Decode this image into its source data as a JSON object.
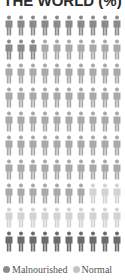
{
  "title": "THE WORLD (%)",
  "legend": [
    {
      "label": "Malnourished",
      "color": "#8c8c8c"
    },
    {
      "label": "Normal",
      "color": "#c4c4c4"
    }
  ],
  "colors": {
    "dark": "#8a8a8a",
    "medium": "#a9a9a9",
    "light": "#d3d3d3",
    "darkest": "#6b6b6b"
  },
  "chart_data": {
    "type": "pictogram",
    "title": "THE WORLD (%)",
    "grid": {
      "rows": 10,
      "cols": 10,
      "unit": "1 figure = 1%"
    },
    "rows": [
      [
        "dark",
        "dark",
        "dark",
        "dark",
        "dark",
        "dark",
        "dark",
        "dark",
        "dark",
        "dark"
      ],
      [
        "dark",
        "dark",
        "dark",
        "medium",
        "medium",
        "medium",
        "medium",
        "medium",
        "medium",
        "medium"
      ],
      [
        "medium",
        "medium",
        "medium",
        "medium",
        "medium",
        "medium",
        "medium",
        "medium",
        "medium",
        "medium"
      ],
      [
        "medium",
        "medium",
        "medium",
        "medium",
        "medium",
        "medium",
        "medium",
        "medium",
        "medium",
        "medium"
      ],
      [
        "medium",
        "medium",
        "medium",
        "medium",
        "medium",
        "medium",
        "medium",
        "medium",
        "medium",
        "medium"
      ],
      [
        "medium",
        "medium",
        "medium",
        "medium",
        "medium",
        "medium",
        "medium",
        "medium",
        "medium",
        "medium"
      ],
      [
        "medium",
        "medium",
        "medium",
        "medium",
        "medium",
        "medium",
        "medium",
        "medium",
        "medium",
        "medium"
      ],
      [
        "medium",
        "medium",
        "medium",
        "medium",
        "medium",
        "medium",
        "medium",
        "light",
        "light",
        "light"
      ],
      [
        "light",
        "light",
        "light",
        "light",
        "light",
        "light",
        "light",
        "light",
        "light",
        "light"
      ],
      [
        "darkest",
        "darkest",
        "darkest",
        "darkest",
        "darkest",
        "darkest",
        "darkest",
        "darkest",
        "darkest",
        "darkest"
      ]
    ],
    "counts": {
      "dark": 13,
      "medium": 64,
      "light": 13,
      "darkest": 10
    },
    "legend": [
      "Malnourished",
      "Normal"
    ]
  }
}
